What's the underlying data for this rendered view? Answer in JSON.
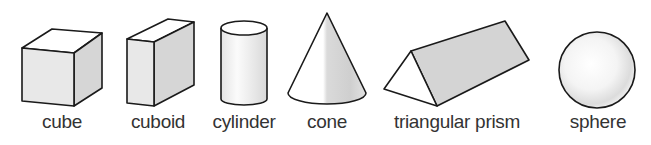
{
  "figure": {
    "shapes": [
      {
        "id": "cube",
        "label": "cube",
        "center_x": 62
      },
      {
        "id": "cuboid",
        "label": "cuboid",
        "center_x": 158
      },
      {
        "id": "cylinder",
        "label": "cylinder",
        "center_x": 244
      },
      {
        "id": "cone",
        "label": "cone",
        "center_x": 327
      },
      {
        "id": "triangular-prism",
        "label": "triangular prism",
        "center_x": 457
      },
      {
        "id": "sphere",
        "label": "sphere",
        "center_x": 598
      }
    ],
    "colors": {
      "outline": "#1a1a1a",
      "face_light": "#e9e9e9",
      "face_mid": "#d4d4d4",
      "face_top": "#ffffff",
      "text": "#333333"
    }
  }
}
